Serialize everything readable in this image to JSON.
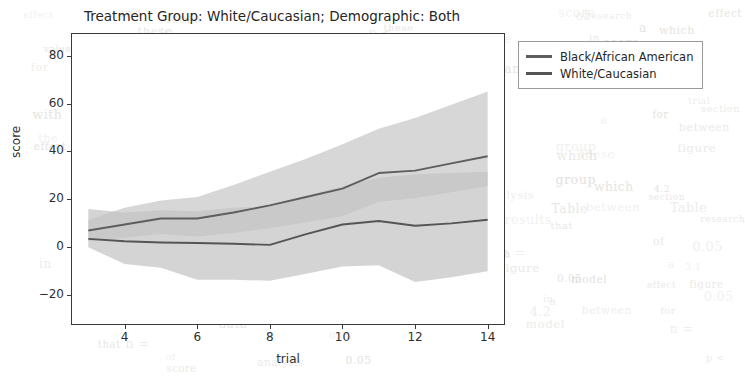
{
  "chart_data": {
    "type": "line",
    "title": "Treatment Group: White/Caucasian; Demographic: Both",
    "xlabel": "trial",
    "ylabel": "score",
    "xlim": [
      2.55,
      14.45
    ],
    "ylim": [
      -32.0,
      89.0
    ],
    "xticks": [
      4,
      6,
      8,
      10,
      12,
      14
    ],
    "yticks": [
      -20,
      0,
      20,
      40,
      60,
      80
    ],
    "grid": false,
    "legend_position": "outside-upper-right",
    "x": [
      3,
      4,
      5,
      6,
      7,
      8,
      9,
      10,
      11,
      12,
      13,
      14
    ],
    "series": [
      {
        "name": "Black/African American",
        "color": "#5e5e5e",
        "band_color": "#cdcdcd",
        "values": [
          7.0,
          9.5,
          12.0,
          12.0,
          14.5,
          17.5,
          21.0,
          24.5,
          31.0,
          32.0,
          35.0,
          38.0
        ],
        "band_lower": [
          2.5,
          4.0,
          5.5,
          4.5,
          6.0,
          8.0,
          10.5,
          13.0,
          19.0,
          20.5,
          23.0,
          25.5
        ],
        "band_upper": [
          11.5,
          16.5,
          19.5,
          21.0,
          26.0,
          31.5,
          37.0,
          43.0,
          49.5,
          54.0,
          59.5,
          65.0
        ]
      },
      {
        "name": "White/Caucasian",
        "color": "#555555",
        "band_color": "#c4c4c4",
        "values": [
          3.5,
          2.5,
          2.0,
          1.8,
          1.5,
          1.0,
          5.5,
          9.5,
          11.0,
          9.0,
          10.0,
          11.5
        ],
        "band_lower": [
          0.0,
          -7.0,
          -8.5,
          -13.5,
          -13.5,
          -14.0,
          -11.0,
          -8.0,
          -7.5,
          -14.5,
          -12.5,
          -10.0
        ],
        "band_upper": [
          16.0,
          14.5,
          15.5,
          15.0,
          16.5,
          17.0,
          21.5,
          25.5,
          29.0,
          30.5,
          31.0,
          31.5
        ]
      }
    ]
  },
  "legend": {
    "items": [
      {
        "label": "Black/African American"
      },
      {
        "label": "White/Caucasian"
      }
    ]
  },
  "background_text": {
    "fragments": [
      "the",
      "of",
      "and",
      "to",
      "in",
      "a",
      "with",
      "for",
      "research",
      "results",
      "analysis",
      "model",
      "data",
      "values",
      "treatment",
      "effect",
      "group",
      "score",
      "trial",
      "figure",
      "section",
      "shows",
      "that",
      "which",
      "these",
      "between",
      "0.05",
      "p <",
      "n =",
      "Table",
      "4.2",
      "3.1"
    ]
  }
}
